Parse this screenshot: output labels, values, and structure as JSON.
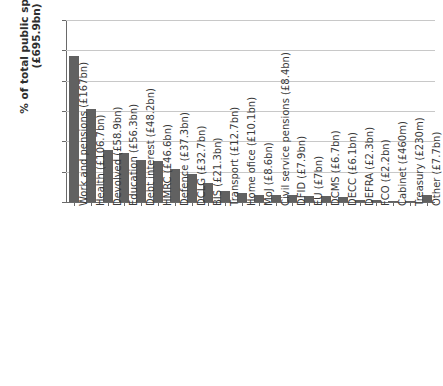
{
  "chart_data": {
    "type": "bar",
    "title": "",
    "xlabel": "",
    "ylabel": "% of total public spending (£695.9bn)",
    "ylim": [
      0,
      30
    ],
    "ytick_labels": [
      "30%",
      "25%",
      "20%",
      "15%",
      "10%",
      "5%",
      "0%"
    ],
    "ytick_values": [
      30,
      25,
      20,
      15,
      10,
      5,
      0
    ],
    "grid": true,
    "legend": "none",
    "bar_color": "#616161",
    "categories": [
      "Work and pensions (£167bn)",
      "Health (£106.7bn)",
      "Devolved (£58.9bn)",
      "Education (£56.3bn)",
      "Debt interest (£48.2bn)",
      "HMRC (£46.6bn)",
      "Defence (£37.3bn)",
      "DCLG (£32.7bn)",
      "BIS (£21.3bn)",
      "Transport (£12.7bn)",
      "Home ofice (£10.1bn)",
      "MoJ (£8.6bn)",
      "Civil service pensions (£8.4bn)",
      "DFID (£7.9bn)",
      "EU (£7bn)",
      "DCMS (£6.7bn)",
      "DECC (£6.1bn)",
      "DEFRA (£2.3bn)",
      "FCO (£2.2bn)",
      "Cabinet (£460m)",
      "Treasury (£230m)",
      "Other (£7.7bn)"
    ],
    "values": [
      24.0,
      15.3,
      8.5,
      8.1,
      6.9,
      6.7,
      5.4,
      4.7,
      3.1,
      1.8,
      1.5,
      1.2,
      1.2,
      1.1,
      1.0,
      1.0,
      0.9,
      0.3,
      0.3,
      0.07,
      0.03,
      1.1
    ]
  }
}
